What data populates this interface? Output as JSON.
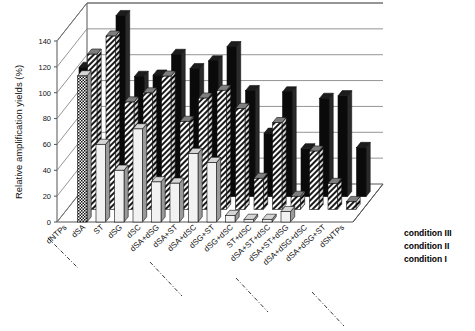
{
  "chart_data": {
    "type": "bar",
    "title": "",
    "subtitle": "",
    "xlabel": "",
    "ylabel": "Relative amplification yields (%)",
    "zlabel": "",
    "ylim": [
      0,
      140
    ],
    "ytick_step": 20,
    "yticks": [
      "0",
      "20",
      "40",
      "60",
      "80",
      "100",
      "120",
      "140"
    ],
    "grid": true,
    "projection": "3d",
    "legend_position": "right-depth-axis",
    "categories": [
      "dNTPs",
      "dSA",
      "ST",
      "dSG",
      "dSC",
      "dSA+dSG",
      "dSA+ST",
      "dSA+dSC",
      "dSG+ST",
      "dSG+dSC",
      "ST+dSC",
      "dSA+ST+dSC",
      "dSA+ST+dSG",
      "dSA+dSG+dSC",
      "dSA+dSG+ST",
      "dSNTPs"
    ],
    "depth_categories": [
      "condition I",
      "condition II",
      "condition III"
    ],
    "series": [
      {
        "name": "condition I",
        "pattern": "white",
        "values": [
          0,
          113,
          60,
          40,
          72,
          31,
          30,
          53,
          46,
          5,
          2,
          2,
          8,
          0,
          0,
          0
        ]
      },
      {
        "name": "condition II",
        "pattern": "diagonal-hatch",
        "values": [
          0,
          120,
          134,
          83,
          90,
          103,
          68,
          86,
          92,
          78,
          24,
          67,
          10,
          45,
          20,
          6
        ]
      },
      {
        "name": "condition III",
        "pattern": "black",
        "values": [
          100,
          0,
          140,
          93,
          94,
          110,
          99,
          105,
          116,
          82,
          49,
          81,
          37,
          76,
          78,
          38
        ]
      }
    ]
  },
  "legend": {
    "items": [
      {
        "label": "condition III"
      },
      {
        "label": "condition II"
      },
      {
        "label": "condition I"
      }
    ]
  },
  "axes": {
    "y_title": "Relative amplification yields (%)"
  }
}
